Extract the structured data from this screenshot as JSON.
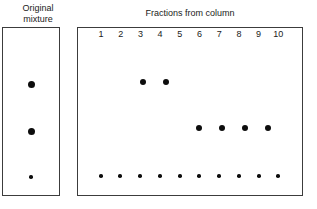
{
  "figure": {
    "original_panel": {
      "label": "Original\nmixture",
      "spots": [
        {
          "name": "original-spot-top",
          "size": "large",
          "x": 31,
          "y": 84
        },
        {
          "name": "original-spot-middle",
          "size": "large",
          "x": 31,
          "y": 131
        },
        {
          "name": "original-spot-bottom",
          "size": "small",
          "x": 31,
          "y": 177
        }
      ]
    },
    "fractions_panel": {
      "title": "Fractions from column",
      "column_labels": [
        "1",
        "2",
        "3",
        "4",
        "5",
        "6",
        "7",
        "8",
        "9",
        "10"
      ],
      "column_x": [
        101,
        120,
        143,
        166,
        189,
        199,
        222,
        245,
        268,
        278
      ],
      "rows": [
        {
          "name": "upper-band-row",
          "y": 82,
          "size": "medium",
          "columns": [
            "3",
            "4"
          ],
          "x": [
            143,
            166
          ]
        },
        {
          "name": "middle-band-row",
          "y": 128,
          "size": "medium",
          "columns": [
            "6",
            "7",
            "8",
            "9"
          ],
          "x": [
            199,
            222,
            245,
            268
          ]
        },
        {
          "name": "baseline-row",
          "y": 176,
          "size": "small",
          "columns": [
            "1",
            "2",
            "3",
            "4",
            "5",
            "6",
            "7",
            "8",
            "9",
            "10"
          ],
          "x": [
            101,
            120,
            140,
            160,
            180,
            199,
            219,
            239,
            259,
            278
          ]
        }
      ]
    }
  },
  "colors": {
    "spot": "#0d0d0d",
    "border": "#3c3c3c",
    "background": "#ffffff",
    "text": "#1a1a1a"
  }
}
